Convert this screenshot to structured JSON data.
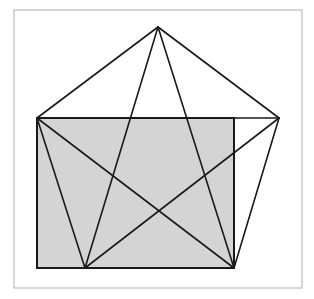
{
  "figure": {
    "colors": {
      "background": "#ffffff",
      "frame": "#b0b0b0",
      "rect_fill": "#d4d4d4",
      "stroke": "#1a1a1a"
    },
    "frame": {
      "x": 14,
      "y": 10,
      "w": 288,
      "h": 278
    },
    "rectangle": {
      "x": 37,
      "y": 118,
      "w": 197,
      "h": 150
    },
    "pentagon_vertices": {
      "top": [
        158,
        27
      ],
      "left": [
        37,
        118
      ],
      "right": [
        279,
        118
      ],
      "bottom_left": [
        85,
        268
      ],
      "bottom_right": [
        234,
        268
      ]
    }
  }
}
